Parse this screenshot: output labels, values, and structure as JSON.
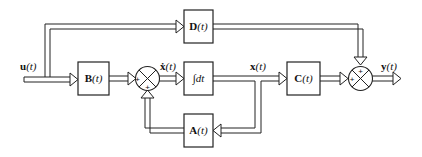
{
  "diagram": {
    "type": "block_diagram",
    "blocks": {
      "D": {
        "label": "D",
        "arg": "(t)"
      },
      "B": {
        "label": "B",
        "arg": "(t)"
      },
      "integrator": {
        "label": "∫dt"
      },
      "C": {
        "label": "C",
        "arg": "(t)"
      },
      "A": {
        "label": "A",
        "arg": "(t)"
      }
    },
    "signals": {
      "input": {
        "label": "u",
        "arg": "(t)"
      },
      "xdot": {
        "label": "ẋ",
        "arg": "(t)"
      },
      "state": {
        "label": "x",
        "arg": "(t)"
      },
      "output": {
        "label": "y",
        "arg": "(t)"
      }
    },
    "summing_junctions": {
      "sum1": {
        "signs": [
          "+",
          "+"
        ]
      },
      "sum2": {
        "signs": [
          "+",
          "+"
        ]
      }
    },
    "connections": [
      "u(t) -> B(t)",
      "u(t) -> D(t)",
      "B(t) -> sum1",
      "A(t) -> sum1",
      "sum1 -> ∫dt (ẋ(t))",
      "∫dt -> C(t) (x(t))",
      "x(t) -> A(t)",
      "C(t) -> sum2",
      "D(t) -> sum2",
      "sum2 -> y(t)"
    ]
  }
}
